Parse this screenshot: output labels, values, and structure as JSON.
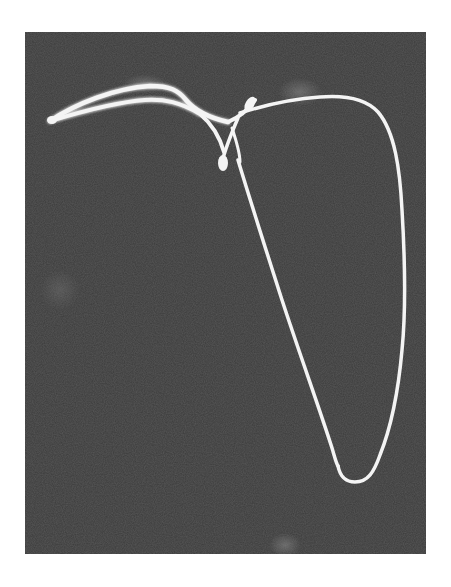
{
  "image": {
    "subject": "oscilloscope trace photograph of a looping curve",
    "background_color": "#3b3b3b",
    "trace_color": "#f4f4f4",
    "page_color": "#ffffff"
  }
}
